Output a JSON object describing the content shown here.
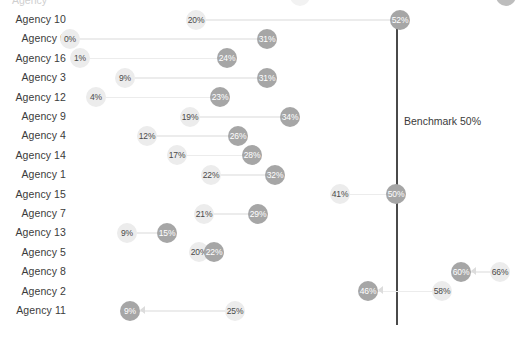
{
  "chart_data": {
    "type": "scatter",
    "subtype": "dumbbell",
    "title": "",
    "xlabel": "",
    "ylabel": "",
    "xlim": [
      0,
      70
    ],
    "grid": false,
    "legend": "none",
    "categories": [
      "Agency 10",
      "Agency 6",
      "Agency 16",
      "Agency 3",
      "Agency 12",
      "Agency 9",
      "Agency 4",
      "Agency 14",
      "Agency 1",
      "Agency 15",
      "Agency 7",
      "Agency 13",
      "Agency 5",
      "Agency 8",
      "Agency 2",
      "Agency 11"
    ],
    "series": [
      {
        "name": "start",
        "values": [
          20,
          0,
          1,
          9,
          4,
          19,
          12,
          17,
          22,
          41,
          21,
          9,
          20,
          66,
          58,
          25
        ]
      },
      {
        "name": "end",
        "values": [
          52,
          31,
          24,
          31,
          23,
          34,
          26,
          28,
          32,
          50,
          29,
          15,
          22,
          60,
          46,
          9
        ]
      }
    ],
    "annotations": [
      {
        "type": "vline",
        "value": 50,
        "label": "Benchmark 50%"
      }
    ],
    "colors": {
      "start": "#ececec",
      "end": "#a6a6a6",
      "connector": "#ececec",
      "benchmark": "#4a4a4a",
      "text": "#3b3b3b"
    }
  },
  "benchmark": {
    "label": "Benchmark 50%",
    "value": 50
  },
  "rows": [
    {
      "label": "Agency 10",
      "start": "20%",
      "end": "52%",
      "start_x": 196,
      "end_x": 400,
      "direction": "right"
    },
    {
      "label": "Agency 6",
      "start": "0%",
      "end": "31%",
      "start_x": 70,
      "end_x": 267,
      "direction": "right"
    },
    {
      "label": "Agency 16",
      "start": "1%",
      "end": "24%",
      "start_x": 80,
      "end_x": 227,
      "direction": "right"
    },
    {
      "label": "Agency 3",
      "start": "9%",
      "end": "31%",
      "start_x": 125,
      "end_x": 267,
      "direction": "right"
    },
    {
      "label": "Agency 12",
      "start": "4%",
      "end": "23%",
      "start_x": 96,
      "end_x": 220,
      "direction": "right"
    },
    {
      "label": "Agency 9",
      "start": "19%",
      "end": "34%",
      "start_x": 190,
      "end_x": 290,
      "direction": "right"
    },
    {
      "label": "Agency 4",
      "start": "12%",
      "end": "26%",
      "start_x": 147,
      "end_x": 238,
      "direction": "right"
    },
    {
      "label": "Agency 14",
      "start": "17%",
      "end": "28%",
      "start_x": 177,
      "end_x": 252,
      "direction": "right"
    },
    {
      "label": "Agency 1",
      "start": "22%",
      "end": "32%",
      "start_x": 211,
      "end_x": 275,
      "direction": "right"
    },
    {
      "label": "Agency 15",
      "start": "41%",
      "end": "50%",
      "start_x": 340,
      "end_x": 396,
      "direction": "right"
    },
    {
      "label": "Agency 7",
      "start": "21%",
      "end": "29%",
      "start_x": 204,
      "end_x": 258,
      "direction": "right"
    },
    {
      "label": "Agency 13",
      "start": "9%",
      "end": "15%",
      "start_x": 127,
      "end_x": 167,
      "direction": "right"
    },
    {
      "label": "Agency 5",
      "start": "20%",
      "end": "22%",
      "start_x": 199,
      "end_x": 214,
      "direction": "right"
    },
    {
      "label": "Agency 8",
      "start": "66%",
      "end": "60%",
      "start_x": 500,
      "end_x": 461,
      "direction": "left"
    },
    {
      "label": "Agency 2",
      "start": "58%",
      "end": "46%",
      "start_x": 442,
      "end_x": 368,
      "direction": "left"
    },
    {
      "label": "Agency 11",
      "start": "25%",
      "end": "9%",
      "start_x": 235,
      "end_x": 130,
      "direction": "left"
    }
  ]
}
